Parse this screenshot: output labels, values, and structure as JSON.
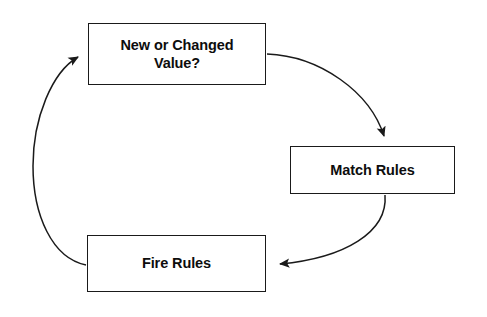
{
  "diagram": {
    "type": "flowchart-cycle",
    "title": "",
    "background_color": "#ffffff",
    "stroke_color": "#1a1a1a",
    "text_color": "#0d0d0d",
    "nodes": [
      {
        "id": "new-changed-value",
        "label": "New or Changed\nValue?",
        "shape": "rectangle"
      },
      {
        "id": "match-rules",
        "label": "Match Rules",
        "shape": "rectangle"
      },
      {
        "id": "fire-rules",
        "label": "Fire Rules",
        "shape": "rectangle"
      }
    ],
    "edges": [
      {
        "id": "edge-value-to-match",
        "from": "new-changed-value",
        "to": "match-rules",
        "label": "",
        "style": "curved-arrow"
      },
      {
        "id": "edge-match-to-fire",
        "from": "match-rules",
        "to": "fire-rules",
        "label": "",
        "style": "curved-arrow"
      },
      {
        "id": "edge-fire-to-value",
        "from": "fire-rules",
        "to": "new-changed-value",
        "label": "",
        "style": "curved-arrow"
      }
    ]
  }
}
